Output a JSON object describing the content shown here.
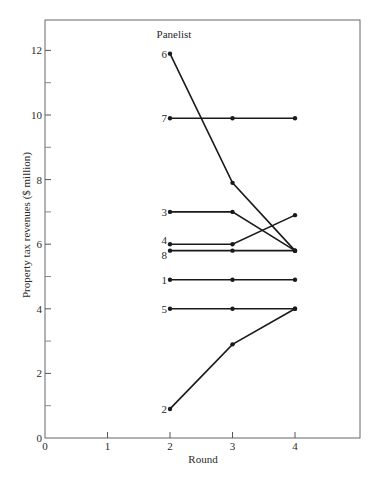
{
  "chart_data": {
    "type": "line",
    "title": "Panelist",
    "xlabel": "Round",
    "ylabel": "Property tax revenues ($ million)",
    "xlim": [
      0,
      5
    ],
    "ylim": [
      0,
      13
    ],
    "x_ticks": [
      0,
      1,
      2,
      3,
      4
    ],
    "x_tick_labels": [
      "0",
      "1",
      "2",
      "3",
      "4"
    ],
    "y_ticks_major": [
      0,
      2,
      4,
      6,
      8,
      10,
      12
    ],
    "y_tick_labels": [
      "0",
      "2",
      "4",
      "6",
      "8",
      "10",
      "12"
    ],
    "y_ticks_minor": [
      1,
      3,
      5,
      7,
      9,
      11
    ],
    "grid": false,
    "legend": "none (series labeled inline at round 2)",
    "x": [
      2,
      3,
      4
    ],
    "series": [
      {
        "name": "6",
        "values": [
          11.9,
          7.9,
          5.8
        ]
      },
      {
        "name": "7",
        "values": [
          9.9,
          9.9,
          9.9
        ]
      },
      {
        "name": "3",
        "values": [
          7.0,
          7.0,
          5.8
        ]
      },
      {
        "name": "4",
        "values": [
          6.0,
          6.0,
          6.9
        ]
      },
      {
        "name": "8",
        "values": [
          5.8,
          5.8,
          5.8
        ]
      },
      {
        "name": "1",
        "values": [
          4.9,
          4.9,
          4.9
        ]
      },
      {
        "name": "5",
        "values": [
          4.0,
          4.0,
          4.0
        ]
      },
      {
        "name": "2",
        "values": [
          0.9,
          2.9,
          4.0
        ]
      }
    ]
  },
  "style": {
    "line_color": "#1a1a1a",
    "axis_color": "#555555",
    "background": "#ffffff"
  }
}
